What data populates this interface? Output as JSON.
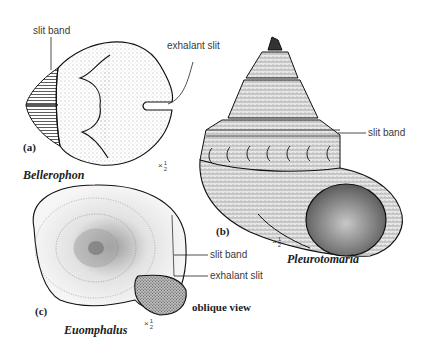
{
  "figure": {
    "panels": [
      {
        "id": "a",
        "panel_label": "(a)",
        "taxon": "Bellerophon",
        "scale": {
          "prefix": "×",
          "num": "1",
          "den": "2"
        },
        "annotations": [
          "slit band",
          "exhalant slit"
        ]
      },
      {
        "id": "b",
        "panel_label": "(b)",
        "taxon": "Pleurotomaria",
        "scale": {
          "prefix": "×",
          "num": "1",
          "den": "2"
        },
        "annotations": [
          "slit band"
        ]
      },
      {
        "id": "c",
        "panel_label": "(c)",
        "taxon": "Euomphalus",
        "view": "oblique view",
        "scale": {
          "prefix": "×",
          "num": "1",
          "den": "2"
        },
        "annotations": [
          "slit band",
          "exhalant slit"
        ]
      }
    ]
  }
}
